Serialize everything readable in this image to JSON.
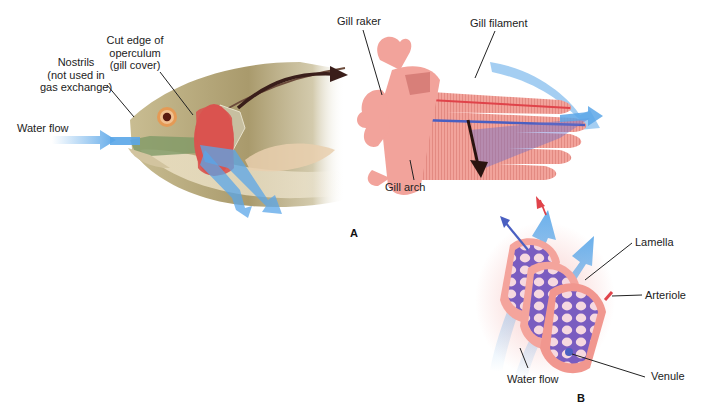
{
  "figure": {
    "panels": [
      {
        "id": "A",
        "letter": "A"
      },
      {
        "id": "B",
        "letter": "B"
      }
    ],
    "labels": {
      "water_flow_a": "Water flow",
      "nostrils_1": "Nostrils",
      "nostrils_2": "(not used in",
      "nostrils_3": "gas exchange)",
      "operculum_1": "Cut edge of",
      "operculum_2": "operculum",
      "operculum_3": "(gill cover)",
      "gill_raker": "Gill raker",
      "gill_filament": "Gill filament",
      "gill_arch": "Gill arch",
      "lamella": "Lamella",
      "arteriole": "Arteriole",
      "venule": "Venule",
      "water_flow_b": "Water flow"
    },
    "colors": {
      "fish_body": "#b5a77a",
      "fish_belly": "#e8dcc0",
      "gill_red": "#d9534f",
      "gill_pink": "#f0a39a",
      "water_blue": "#5aa6e8",
      "mouth_green": "#7f9a66",
      "vein_blue": "#4a5fc1",
      "artery_red": "#e0434a",
      "arrow_dark": "#3a1e1a",
      "leader_line": "#222222"
    }
  }
}
